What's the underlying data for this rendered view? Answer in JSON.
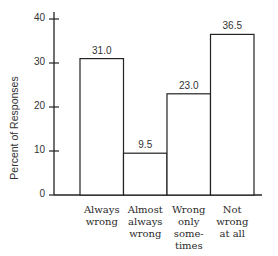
{
  "chart_data": {
    "type": "bar",
    "title": "",
    "xlabel": "",
    "ylabel": "Percent of Responses",
    "ylim": [
      0,
      40
    ],
    "yticks": [
      0,
      10,
      20,
      30,
      40
    ],
    "grid": false,
    "legend": null,
    "categories": [
      "Always wrong",
      "Almost always wrong",
      "Wrong only sometimes",
      "Not wrong at all"
    ],
    "category_lines": [
      "Always\nwrong",
      "Almost\nalways\nwrong",
      "Wrong\nonly\nsome-\ntimes",
      "Not\nwrong\nat all"
    ],
    "values": [
      31.0,
      9.5,
      23.0,
      36.5
    ],
    "value_labels": [
      "31.0",
      "9.5",
      "23.0",
      "36.5"
    ]
  },
  "axis": {
    "ylabel": "Percent of Responses",
    "ticks": [
      "0",
      "10",
      "20",
      "30",
      "40"
    ]
  }
}
